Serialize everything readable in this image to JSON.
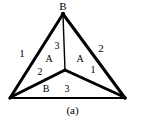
{
  "figure": {
    "caption": "(a)",
    "background_color": "#ffffff",
    "stroke_color": "#000000",
    "width": 145,
    "height": 126
  },
  "diagram": {
    "type": "triangle-with-central-y-junction",
    "vertices": {
      "top": {
        "x": 63,
        "y": 14,
        "label": "B"
      },
      "bottom_left": {
        "x": 10,
        "y": 98,
        "label": ""
      },
      "bottom_right": {
        "x": 125,
        "y": 98,
        "label": ""
      },
      "center": {
        "x": 65,
        "y": 70,
        "label": ""
      }
    },
    "edges": [
      {
        "name": "left-outer-edge",
        "from": "top",
        "to": "bottom_left",
        "width": 3
      },
      {
        "name": "right-outer-edge",
        "from": "top",
        "to": "bottom_right",
        "width": 3
      },
      {
        "name": "bottom-outer-edge",
        "from": "bottom_left",
        "to": "bottom_right",
        "width": 2
      },
      {
        "name": "center-to-top-spoke",
        "from": "center",
        "to": "top",
        "width": 1.4
      },
      {
        "name": "center-to-bottom-left-spoke",
        "from": "center",
        "to": "bottom_left",
        "width": 3
      },
      {
        "name": "center-to-bottom-right-spoke",
        "from": "center",
        "to": "bottom_right",
        "width": 3
      }
    ]
  },
  "labels": [
    {
      "name": "vertex-label-top-b",
      "text": "B",
      "x": 63,
      "y": 6
    },
    {
      "name": "edge-label-left-1",
      "text": "1",
      "x": 22,
      "y": 53
    },
    {
      "name": "edge-label-right-2",
      "text": "2",
      "x": 101,
      "y": 48
    },
    {
      "name": "spoke-label-top-3",
      "text": "3",
      "x": 57,
      "y": 45
    },
    {
      "name": "region-label-left-a",
      "text": "A",
      "x": 49,
      "y": 58
    },
    {
      "name": "region-label-right-a",
      "text": "A",
      "x": 80,
      "y": 58
    },
    {
      "name": "spoke-label-left-2",
      "text": "2",
      "x": 40,
      "y": 71
    },
    {
      "name": "spoke-label-right-1",
      "text": "1",
      "x": 93,
      "y": 69
    },
    {
      "name": "bottom-label-b",
      "text": "B",
      "x": 46,
      "y": 88
    },
    {
      "name": "bottom-label-3",
      "text": "3",
      "x": 67,
      "y": 88
    }
  ]
}
